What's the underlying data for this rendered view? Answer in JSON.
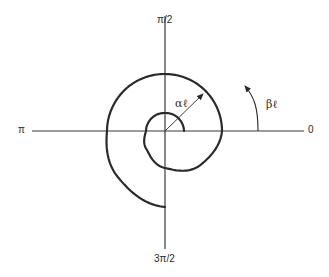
{
  "figure": {
    "type": "polar-spiral-diagram",
    "width": 329,
    "height": 277,
    "origin": {
      "x": 165,
      "y": 131
    },
    "colors": {
      "background": "#ffffff",
      "stroke": "#2a2a2a",
      "axis": "#3a3a3a"
    }
  },
  "axes": {
    "horizontal": {
      "x1": 32,
      "x2": 304,
      "y": 131
    },
    "vertical": {
      "x": 165,
      "y1": 16,
      "y2": 249
    },
    "labels": {
      "top": "π/2",
      "left": "π",
      "right": "0",
      "bottom": "3π/2"
    }
  },
  "spiral": {
    "description": "Spiral starting on positive x-axis near origin, winding counterclockwise nearly two turns, ending on negative y-axis",
    "samples_theta_deg": [
      0,
      45,
      90,
      135,
      180,
      225,
      270,
      315,
      360,
      405,
      450,
      495,
      540,
      585,
      630
    ],
    "samples_radius_px": [
      19,
      18.5,
      18,
      18.5,
      19,
      26,
      37,
      49,
      57,
      57,
      57,
      57.5,
      58,
      66,
      76
    ],
    "stroke_width": 2.2
  },
  "annotations": {
    "alpha": {
      "text": "αℓ",
      "arrow": {
        "x1": 165,
        "y1": 131,
        "x2": 203,
        "y2": 94
      }
    },
    "beta": {
      "text": "βℓ",
      "arrow_start": {
        "x": 258,
        "y": 131
      },
      "arrow_tip": {
        "x": 245,
        "y": 86
      }
    }
  }
}
